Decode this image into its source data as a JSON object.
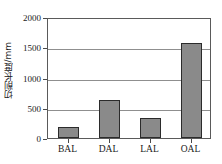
{
  "chart_data": {
    "type": "bar",
    "title": "",
    "subtitle": "",
    "xlabel": "",
    "ylabel": "切削长度/mm",
    "categories": [
      "BAL",
      "DAL",
      "LAL",
      "OAL"
    ],
    "values": [
      180,
      630,
      330,
      1570
    ],
    "ylim": [
      0,
      2000
    ],
    "ytick_labels": [
      "0",
      "500",
      "1000",
      "1500",
      "2000"
    ],
    "ytick_values": [
      0,
      500,
      1000,
      1500,
      2000
    ],
    "grid": "horizontal",
    "legend": "none",
    "bar_color": "#8a8a8a",
    "bar_edge_color": "#2b2b2b",
    "gridline_color": "#8f8f8f",
    "frame_color": "#5a5a5a",
    "text_color": "#1a1a1a",
    "annotations": []
  }
}
